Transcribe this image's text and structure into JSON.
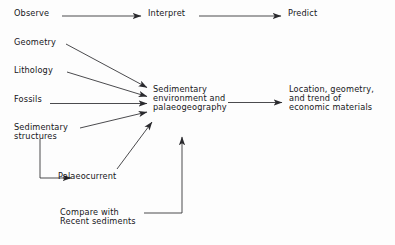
{
  "diagram": {
    "type": "flowchart",
    "title_text": "",
    "background_color": "#fdfdfd",
    "line_color": "#2a2a2e",
    "text_color": "#16161a",
    "nodes": [
      {
        "id": "observe",
        "label": "Observe",
        "x": 14,
        "y": 9
      },
      {
        "id": "interpret",
        "label": "Interpret",
        "x": 148,
        "y": 9
      },
      {
        "id": "predict",
        "label": "Predict",
        "x": 288,
        "y": 9
      },
      {
        "id": "geometry",
        "label": "Geometry",
        "x": 14,
        "y": 38
      },
      {
        "id": "lithology",
        "label": "Lithology",
        "x": 14,
        "y": 66
      },
      {
        "id": "fossils",
        "label": "Fossils",
        "x": 14,
        "y": 95
      },
      {
        "id": "sedimentary-structures",
        "label": "Sedimentary\nstructures",
        "x": 14,
        "y": 123
      },
      {
        "id": "palaeocurrent",
        "label": "Palaeocurrent",
        "x": 58,
        "y": 172
      },
      {
        "id": "sedimentary-environment",
        "label": "Sedimentary\nenvironment and\npalaeogeography",
        "x": 153,
        "y": 85
      },
      {
        "id": "economic-materials",
        "label": "Location, geometry,\nand trend of\neconomic materials",
        "x": 289,
        "y": 85
      },
      {
        "id": "compare-recent",
        "label": "Compare with\nRecent sediments",
        "x": 60,
        "y": 208
      }
    ],
    "edges": [
      {
        "id": "observe-to-interpret",
        "from": "observe",
        "to": "interpret",
        "style": "straight-arrow"
      },
      {
        "id": "interpret-to-predict",
        "from": "interpret",
        "to": "predict",
        "style": "straight-arrow"
      },
      {
        "id": "geometry-to-environment",
        "from": "geometry",
        "to": "sedimentary-environment",
        "style": "diagonal-arrow"
      },
      {
        "id": "lithology-to-environment",
        "from": "lithology",
        "to": "sedimentary-environment",
        "style": "diagonal-arrow"
      },
      {
        "id": "fossils-to-environment",
        "from": "fossils",
        "to": "sedimentary-environment",
        "style": "straight-arrow"
      },
      {
        "id": "structures-to-environment",
        "from": "sedimentary-structures",
        "to": "sedimentary-environment",
        "style": "diagonal-arrow"
      },
      {
        "id": "structures-to-palaeocurrent",
        "from": "sedimentary-structures",
        "to": "palaeocurrent",
        "style": "elbow-arrow"
      },
      {
        "id": "palaeocurrent-to-environment",
        "from": "palaeocurrent",
        "to": "sedimentary-environment",
        "style": "diagonal-arrow"
      },
      {
        "id": "environment-to-economic",
        "from": "sedimentary-environment",
        "to": "economic-materials",
        "style": "straight-arrow"
      },
      {
        "id": "compare-to-environment",
        "from": "compare-recent",
        "to": "sedimentary-environment",
        "style": "elbow-arrow-up"
      }
    ]
  }
}
